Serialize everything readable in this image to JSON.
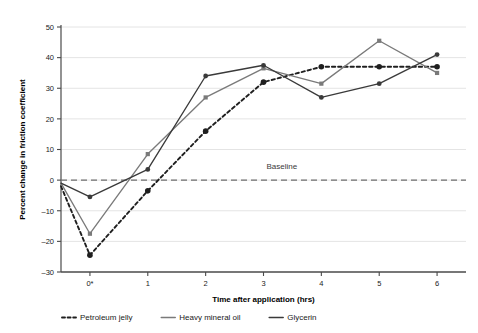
{
  "chart_data": {
    "type": "line",
    "title": "",
    "xlabel": "Time after application (hrs)",
    "ylabel": "Percent change in friction coefficient",
    "x": [
      0,
      1,
      2,
      3,
      4,
      5,
      6,
      7
    ],
    "categories": [
      "0*",
      "",
      "1",
      "",
      "2",
      "",
      "3",
      "",
      "4",
      "",
      "5",
      "",
      "6"
    ],
    "xtick_labels": [
      "0*",
      "1",
      "2",
      "3",
      "4",
      "5",
      "6"
    ],
    "xtick_values": [
      0.5,
      1.5,
      2.5,
      3.5,
      4.5,
      5.5,
      6.5
    ],
    "ytick_labels": [
      "50",
      "40",
      "30",
      "20",
      "10",
      "0",
      "–10",
      "–20",
      "–30"
    ],
    "ytick_values": [
      50,
      40,
      30,
      20,
      10,
      0,
      -10,
      -20,
      -30
    ],
    "xlim": [
      0,
      7
    ],
    "ylim": [
      -30,
      50
    ],
    "grid": "horizontal",
    "legend_position": "below-plot",
    "annotations": [
      {
        "text": "Baseline",
        "x": 3.55,
        "y": 3.5,
        "note": "label for dashed zero reference line"
      }
    ],
    "reference_line": {
      "label": "Baseline",
      "value": 0,
      "style": "dashed",
      "color": "#6f6f6f"
    },
    "series": [
      {
        "name": "Petroleum jelly",
        "style": "dotted",
        "color": "#1f1f1f",
        "marker": "circle",
        "x": [
          0,
          0.5,
          1.5,
          2.5,
          3.5,
          4.5,
          5.5,
          6.5
        ],
        "values": [
          -2,
          -24.5,
          -3.5,
          16,
          32,
          37,
          37,
          37
        ],
        "marker_at": [
          false,
          true,
          true,
          true,
          true,
          true,
          true,
          true
        ]
      },
      {
        "name": "Heavy mineral oil",
        "style": "solid",
        "color": "#7a7a7a",
        "marker": "square",
        "x": [
          0,
          0.5,
          1.5,
          2.5,
          3.5,
          4.5,
          5.5,
          6.5
        ],
        "values": [
          -1,
          -17.5,
          8.5,
          27,
          36.5,
          31.5,
          45.5,
          35
        ],
        "marker_at": [
          false,
          true,
          true,
          true,
          true,
          true,
          true,
          true
        ]
      },
      {
        "name": "Glycerin",
        "style": "solid",
        "color": "#3a3a3a",
        "marker": "circle",
        "x": [
          0,
          0.5,
          1.5,
          2.5,
          3.5,
          4.5,
          5.5,
          6.5
        ],
        "values": [
          -1,
          -5.5,
          3.5,
          34,
          37.5,
          27,
          31.5,
          41
        ],
        "marker_at": [
          false,
          true,
          true,
          true,
          true,
          true,
          true,
          true
        ]
      }
    ]
  },
  "legend": {
    "items": [
      {
        "label": "Petroleum jelly",
        "style": "dotted",
        "color": "#1f1f1f"
      },
      {
        "label": "Heavy mineral oil",
        "style": "solid",
        "color": "#7a7a7a"
      },
      {
        "label": "Glycerin",
        "style": "solid",
        "color": "#3a3a3a"
      }
    ]
  },
  "colors": {
    "axis": "#4a4a4a",
    "grid": "#e4e4e4",
    "baseline": "#6f6f6f",
    "background": "#ffffff"
  }
}
